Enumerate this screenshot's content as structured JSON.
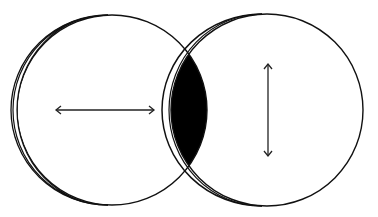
{
  "diagram": {
    "type": "overlapping-circles",
    "background": "#ffffff",
    "stroke_color": "#111111",
    "fill_overlap_color": "#000000",
    "circles": [
      {
        "name": "left-circle",
        "cx": 112,
        "cy": 110,
        "r": 95,
        "crescent": "left"
      },
      {
        "name": "right-circle",
        "cx": 267,
        "cy": 110,
        "r": 96,
        "crescent": "left"
      }
    ],
    "overlap_region": {
      "filled": true,
      "color": "#000000"
    },
    "arrows": [
      {
        "name": "horizontal-double-arrow",
        "orientation": "horizontal",
        "x1": 55,
        "y1": 110,
        "x2": 155,
        "y2": 110,
        "in": "left-circle"
      },
      {
        "name": "vertical-double-arrow",
        "orientation": "vertical",
        "x1": 268,
        "y1": 63,
        "x2": 268,
        "y2": 157,
        "in": "right-circle"
      }
    ]
  }
}
